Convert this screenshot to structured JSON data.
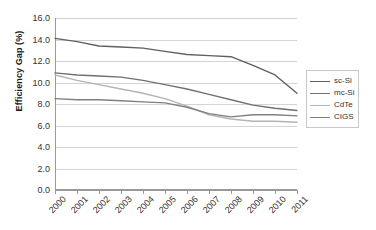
{
  "chart_data": {
    "type": "line",
    "title": "",
    "xlabel": "",
    "ylabel": "Efficiency Gap (%)",
    "categories": [
      "2000",
      "2001",
      "2002",
      "2003",
      "2004",
      "2005",
      "2006",
      "2007",
      "2008",
      "2009",
      "2010",
      "2011"
    ],
    "x": [
      2000,
      2001,
      2002,
      2003,
      2004,
      2005,
      2006,
      2007,
      2008,
      2009,
      2010,
      2011
    ],
    "ylim": [
      0.0,
      16.0
    ],
    "ytick_step": 2.0,
    "ytick_labels": [
      "16.0",
      "14.0",
      "12.0",
      "10.0",
      "8.0",
      "6.0",
      "4.0",
      "2.0",
      "0.0"
    ],
    "ytick_values": [
      16.0,
      14.0,
      12.0,
      10.0,
      8.0,
      6.0,
      4.0,
      2.0,
      0.0
    ],
    "grid": "horizontal",
    "legend_position": "right",
    "series": [
      {
        "name": "sc-Si",
        "color": "#606060",
        "values": [
          14.1,
          13.8,
          13.4,
          13.3,
          13.2,
          12.9,
          12.6,
          12.5,
          12.4,
          11.6,
          10.7,
          9.0
        ]
      },
      {
        "name": "mc-Si",
        "color": "#707070",
        "values": [
          10.9,
          10.7,
          10.6,
          10.5,
          10.2,
          9.8,
          9.4,
          8.9,
          8.4,
          7.9,
          7.6,
          7.4
        ]
      },
      {
        "name": "CdTe",
        "color": "#b4b4b4",
        "values": [
          10.7,
          10.2,
          9.8,
          9.4,
          9.0,
          8.5,
          7.8,
          7.0,
          6.6,
          6.4,
          6.4,
          6.3
        ]
      },
      {
        "name": "CIGS",
        "color": "#808080",
        "values": [
          8.5,
          8.4,
          8.4,
          8.3,
          8.2,
          8.1,
          7.7,
          7.1,
          6.8,
          7.0,
          7.0,
          6.9
        ]
      }
    ]
  }
}
